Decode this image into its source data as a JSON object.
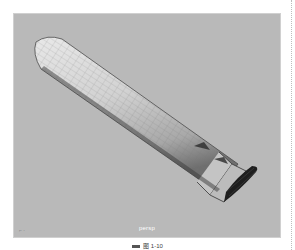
{
  "viewport": {
    "camera_label": "persp",
    "axis_gizmo_label": "⌐ ·",
    "background_color": "#b9b9b9",
    "object": {
      "type": "cylinder-tube",
      "display": "wireframe-on-shaded",
      "steps_at_end": 3
    }
  },
  "caption": {
    "text": "图 1-10"
  }
}
